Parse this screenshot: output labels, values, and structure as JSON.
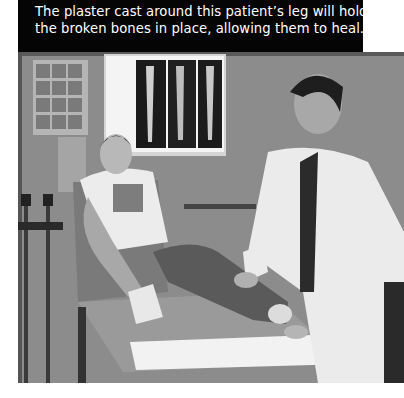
{
  "caption": {
    "lines": [
      "The plaster cast around this patient’s leg will hold",
      "the broken bones in place, allowing them to heal."
    ],
    "background_color": "#050505",
    "text_color": "#ffffff"
  },
  "photo": {
    "alt": "Doctor in a white coat applying a plaster cast to the leg of a young male patient sitting on an examination table; X-rays on a lightbox and crutches in the background",
    "style": "grayscale"
  }
}
